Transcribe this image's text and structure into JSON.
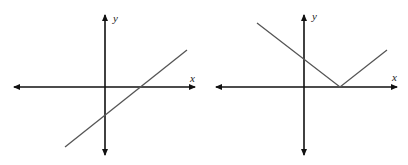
{
  "graphs": [
    {
      "name": "linear-graph",
      "description": "Straight line with positive slope, x-intercept positive, y-intercept negative",
      "x_label": "x",
      "y_label": "y",
      "axis_color": "#111111",
      "curve_color": "#555555"
    },
    {
      "name": "absolute-value-graph",
      "description": "V-shaped graph with vertex on positive x-axis, y-intercept positive",
      "x_label": "x",
      "y_label": "y",
      "axis_color": "#111111",
      "curve_color": "#555555"
    }
  ]
}
